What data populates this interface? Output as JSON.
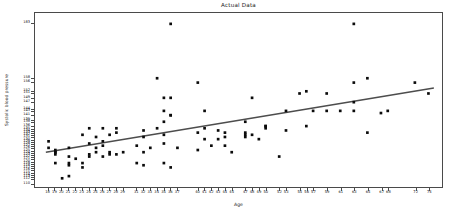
{
  "chart_data": {
    "type": "scatter",
    "title": "Actual Data",
    "xlabel": "Age",
    "ylabel": "Systolic blood pressure",
    "grid": false,
    "legend": null,
    "marker": "square",
    "marker_color": "#0b0b0b",
    "trendline_color": "#4d4d4d",
    "xlim": [
      16,
      76
    ],
    "ylim": [
      108,
      188
    ],
    "xtick_labels": [
      "18",
      "19",
      "20",
      "21",
      "22",
      "23",
      "24",
      "25",
      "26",
      "27",
      "28",
      "29",
      "31",
      "32",
      "33",
      "34",
      "35",
      "36",
      "37",
      "40",
      "41",
      "42",
      "43",
      "44",
      "45",
      "47",
      "48",
      "49",
      "50",
      "52",
      "53",
      "55",
      "56",
      "57",
      "59",
      "61",
      "63",
      "65",
      "67",
      "68",
      "72",
      "74"
    ],
    "xticks": [
      18,
      19,
      20,
      21,
      22,
      23,
      24,
      25,
      26,
      27,
      28,
      29,
      31,
      32,
      33,
      34,
      35,
      36,
      37,
      40,
      41,
      42,
      43,
      44,
      45,
      47,
      48,
      49,
      50,
      52,
      53,
      55,
      56,
      57,
      59,
      61,
      63,
      65,
      67,
      68,
      72,
      74
    ],
    "ytick_labels": [
      "183",
      "158",
      "156",
      "152",
      "151",
      "149",
      "147",
      "144",
      "143",
      "141",
      "139",
      "138",
      "136",
      "135",
      "134",
      "133",
      "132",
      "131",
      "130",
      "129",
      "128",
      "127",
      "126",
      "125",
      "124",
      "123",
      "122",
      "121",
      "120",
      "119",
      "118",
      "117",
      "116",
      "115",
      "114",
      "113",
      "112",
      "110"
    ],
    "yticks": [
      183,
      158,
      156,
      152,
      151,
      149,
      147,
      144,
      143,
      141,
      139,
      138,
      136,
      135,
      134,
      133,
      132,
      131,
      130,
      129,
      128,
      127,
      126,
      125,
      124,
      123,
      122,
      121,
      120,
      119,
      118,
      117,
      116,
      115,
      114,
      113,
      112,
      110
    ],
    "trendline": {
      "x": [
        17.6,
        74.8
      ],
      "y": [
        124.0,
        153.5
      ]
    },
    "points": [
      {
        "x": 18,
        "y": 129
      },
      {
        "x": 18,
        "y": 126
      },
      {
        "x": 19,
        "y": 124
      },
      {
        "x": 19,
        "y": 123
      },
      {
        "x": 19,
        "y": 124
      },
      {
        "x": 19,
        "y": 125
      },
      {
        "x": 19,
        "y": 119
      },
      {
        "x": 20,
        "y": 112
      },
      {
        "x": 21,
        "y": 113
      },
      {
        "x": 21,
        "y": 122
      },
      {
        "x": 21,
        "y": 119
      },
      {
        "x": 21,
        "y": 118
      },
      {
        "x": 21,
        "y": 126
      },
      {
        "x": 22,
        "y": 121
      },
      {
        "x": 23,
        "y": 119
      },
      {
        "x": 23,
        "y": 117
      },
      {
        "x": 23,
        "y": 132
      },
      {
        "x": 24,
        "y": 135
      },
      {
        "x": 24,
        "y": 123
      },
      {
        "x": 24,
        "y": 122
      },
      {
        "x": 24,
        "y": 128
      },
      {
        "x": 25,
        "y": 126
      },
      {
        "x": 25,
        "y": 124
      },
      {
        "x": 25,
        "y": 131
      },
      {
        "x": 26,
        "y": 129
      },
      {
        "x": 26,
        "y": 127
      },
      {
        "x": 26,
        "y": 135
      },
      {
        "x": 26,
        "y": 122
      },
      {
        "x": 27,
        "y": 132
      },
      {
        "x": 27,
        "y": 123
      },
      {
        "x": 27,
        "y": 124
      },
      {
        "x": 28,
        "y": 133
      },
      {
        "x": 28,
        "y": 135
      },
      {
        "x": 28,
        "y": 123
      },
      {
        "x": 29,
        "y": 124
      },
      {
        "x": 31,
        "y": 127
      },
      {
        "x": 31,
        "y": 119
      },
      {
        "x": 32,
        "y": 131
      },
      {
        "x": 32,
        "y": 124
      },
      {
        "x": 32,
        "y": 134
      },
      {
        "x": 32,
        "y": 118
      },
      {
        "x": 33,
        "y": 126
      },
      {
        "x": 34,
        "y": 158
      },
      {
        "x": 34,
        "y": 135
      },
      {
        "x": 35,
        "y": 143
      },
      {
        "x": 35,
        "y": 149
      },
      {
        "x": 35,
        "y": 138
      },
      {
        "x": 35,
        "y": 132
      },
      {
        "x": 35,
        "y": 128
      },
      {
        "x": 35,
        "y": 119
      },
      {
        "x": 36,
        "y": 183
      },
      {
        "x": 36,
        "y": 149
      },
      {
        "x": 36,
        "y": 141
      },
      {
        "x": 36,
        "y": 141
      },
      {
        "x": 36,
        "y": 117
      },
      {
        "x": 37,
        "y": 126
      },
      {
        "x": 40,
        "y": 156
      },
      {
        "x": 40,
        "y": 133
      },
      {
        "x": 40,
        "y": 125
      },
      {
        "x": 41,
        "y": 143
      },
      {
        "x": 41,
        "y": 135
      },
      {
        "x": 41,
        "y": 130
      },
      {
        "x": 42,
        "y": 127
      },
      {
        "x": 43,
        "y": 134
      },
      {
        "x": 43,
        "y": 130
      },
      {
        "x": 44,
        "y": 133
      },
      {
        "x": 44,
        "y": 131
      },
      {
        "x": 44,
        "y": 127
      },
      {
        "x": 45,
        "y": 124
      },
      {
        "x": 47,
        "y": 138
      },
      {
        "x": 47,
        "y": 132
      },
      {
        "x": 47,
        "y": 131
      },
      {
        "x": 47,
        "y": 133
      },
      {
        "x": 48,
        "y": 149
      },
      {
        "x": 48,
        "y": 132
      },
      {
        "x": 49,
        "y": 130
      },
      {
        "x": 50,
        "y": 136
      },
      {
        "x": 50,
        "y": 136
      },
      {
        "x": 50,
        "y": 135
      },
      {
        "x": 52,
        "y": 122
      },
      {
        "x": 53,
        "y": 143
      },
      {
        "x": 53,
        "y": 134
      },
      {
        "x": 55,
        "y": 151
      },
      {
        "x": 56,
        "y": 152
      },
      {
        "x": 56,
        "y": 136
      },
      {
        "x": 57,
        "y": 143
      },
      {
        "x": 59,
        "y": 151
      },
      {
        "x": 59,
        "y": 143
      },
      {
        "x": 61,
        "y": 143
      },
      {
        "x": 63,
        "y": 183
      },
      {
        "x": 63,
        "y": 156
      },
      {
        "x": 63,
        "y": 147
      },
      {
        "x": 63,
        "y": 143
      },
      {
        "x": 65,
        "y": 158
      },
      {
        "x": 65,
        "y": 133
      },
      {
        "x": 67,
        "y": 142
      },
      {
        "x": 68,
        "y": 143
      },
      {
        "x": 72,
        "y": 156
      },
      {
        "x": 74,
        "y": 151
      }
    ]
  }
}
